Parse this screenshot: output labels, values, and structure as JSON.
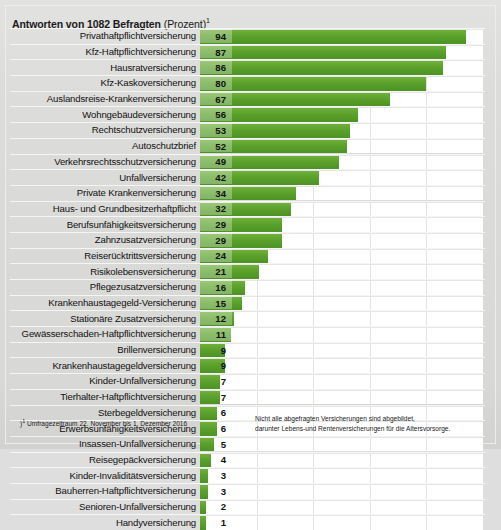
{
  "title": {
    "bold": "Antworten von 1082 Befragten",
    "light": "(in Prozent)",
    "superscript": "1"
  },
  "footnotes": {
    "left_marker": ")",
    "left_superscript": "1",
    "left": "Umfragezeitraum 22. November bis 1. Dezember 2016",
    "right_line1": "Nicht alle abgefragten Versicherungen sind abgebildet,",
    "right_line2": "darunter Lebens-und Rentenversicherungen für die Altersvorsorge."
  },
  "colors": {
    "bar_green": "#5aa12b",
    "background": "#dcdcda",
    "plot_background": "#ffffff",
    "gridline": "#e3e3e1",
    "text": "#111111"
  },
  "chart_data": {
    "type": "bar",
    "orientation": "horizontal",
    "xlabel": "",
    "ylabel": "",
    "xlim": [
      0,
      100
    ],
    "grid": true,
    "gridlines": [
      20,
      40,
      60,
      80
    ],
    "legend": "none",
    "unit": "Prozent",
    "categories": [
      "Privathaftpflichtversicherung",
      "Kfz-Haftpflichtversicherung",
      "Hausratversicherung",
      "Kfz-Kaskoversicherung",
      "Auslandsreise-Krankenversicherung",
      "Wohngebäudeversicherung",
      "Rechtschutzversicherung",
      "Autoschutzbrief",
      "Verkehrsrechtsschutzversicherung",
      "Unfallversicherung",
      "Private Krankenversicherung",
      "Haus- und Grundbesitzerhaftpflicht",
      "Berufsunfähigkeitsversicherung",
      "Zahnzusatzversicherung",
      "Reiserücktrittsversicherung",
      "Risikolebensversicherung",
      "Pflegezusatzversicherung",
      "Krankenhaustagegeld-Versicherung",
      "Stationäre  Zusatzversicherung",
      "Gewässerschaden-Haftpflichtversicherung",
      "Brillenversicherung",
      "Krankenhaustagegeldversicherung",
      "Kinder-Unfallversicherung",
      "Tierhalter-Haftpflichtversicherung",
      "Sterbegeldversicherung",
      "Erwerbsunfähigkeitsversicherung",
      "Insassen-Unfallversicherung",
      "Reisegepäckversicherung",
      "Kinder-Invaliditätsversicherung",
      "Bauherren-Haftpflichtversicherung",
      "Senioren-Unfallversicherung",
      "Handyversicherung"
    ],
    "values": [
      94,
      87,
      86,
      80,
      67,
      56,
      53,
      52,
      49,
      42,
      34,
      32,
      29,
      29,
      24,
      21,
      16,
      15,
      12,
      11,
      9,
      9,
      7,
      7,
      6,
      6,
      5,
      4,
      3,
      3,
      2,
      1
    ]
  }
}
